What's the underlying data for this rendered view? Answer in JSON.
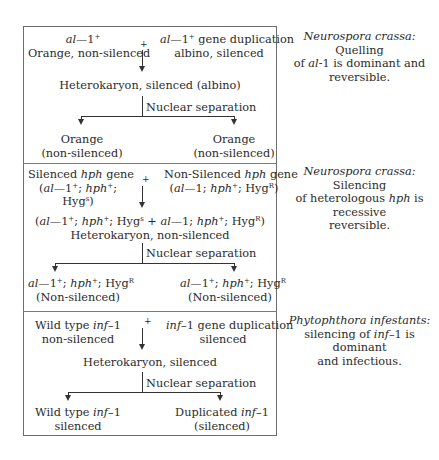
{
  "sections": [
    {
      "parent_left": {
        "line1_italic": "al",
        "line1_rest": "—1",
        "line1_sup": "+",
        "line2": "Orange, non-silenced"
      },
      "parent_right": {
        "line1_italic": "al",
        "line1_rest": "—1",
        "line1_sup": "+",
        "line1_tail": " gene duplication",
        "line2": "albino, silenced"
      },
      "plus": "+",
      "heterokaryon": "Heterokaryon, silenced (albino)",
      "separation_label": "Nuclear separation",
      "child_left": {
        "line1": "Orange",
        "line2": "(non-silenced)"
      },
      "child_right": {
        "line1": "Orange",
        "line2": "(non-silenced)"
      },
      "caption": {
        "organism": "Neurospora crassa:",
        "text1": " Quelling",
        "text2a": "of ",
        "text2_italic": "al",
        "text2b": "-1 is dominant and",
        "text3": "reversible."
      }
    },
    {
      "parent_left": {
        "line1a": "Silenced ",
        "line1_italic": "hph",
        "line1b": " gene",
        "line2": "(al—1+; hph+;",
        "line3": "Hygs)"
      },
      "parent_right": {
        "line1a": "Non-Silenced ",
        "line1_italic": "hph",
        "line1b": " gene",
        "line2": "(al—1; hph+; HygR)"
      },
      "plus": "+",
      "heterokaryon_genotype": "(al—1+; hph+; Hygs + al—1; hph+; HygR)",
      "heterokaryon": "Heterokaryon, non-silenced",
      "separation_label": "Nuclear separation",
      "child_left": {
        "line1": "al—1+; hph+; HygR",
        "line2": "(Non-silenced)"
      },
      "child_right": {
        "line1": "al—1+; hph+; HygR",
        "line2": "(Non-silenced)"
      },
      "caption": {
        "organism": "Neurospora crassa:",
        "text1": " Silencing",
        "text2a": "of heterologous ",
        "text2_italic": "hph",
        "text2b": " is recessive",
        "text3": "reversible."
      }
    },
    {
      "parent_left": {
        "line1a": "Wild type ",
        "line1_italic": "inf",
        "line1b": "–1",
        "line2": "non-silenced"
      },
      "parent_right": {
        "line1_italic": "inf",
        "line1b": "–1 gene duplication",
        "line2": "silenced"
      },
      "plus": "+",
      "heterokaryon": "Heterokaryon, silenced",
      "separation_label": "Nuclear separation",
      "child_left": {
        "line1a": "Wild type ",
        "line1_italic": "inf",
        "line1b": "–1",
        "line2": "silenced"
      },
      "child_right": {
        "line1a": "Duplicated ",
        "line1_italic": "inf",
        "line1b": "–1",
        "line2": "(silenced)"
      },
      "caption": {
        "organism": "Phytophthora infestants:",
        "text2a": "silencing of ",
        "text2_italic": "inf",
        "text2b": "–1 is dominant",
        "text3": "and infectious."
      }
    }
  ]
}
